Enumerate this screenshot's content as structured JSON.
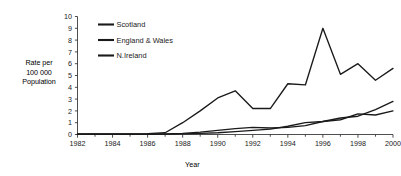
{
  "chart_data": {
    "type": "line",
    "title": "",
    "xlabel": "Year",
    "ylabel": "Rate per 100 000 Population",
    "ylabel_lines": [
      "Rate per",
      "100 000",
      "Population"
    ],
    "xlim": [
      1982,
      2000
    ],
    "ylim": [
      0,
      10
    ],
    "ytick_step": 1,
    "xtick_step": 2,
    "xtick_minor_step": 1,
    "grid": false,
    "legend_position": "top-left-inside",
    "ytick_labels": [
      "0",
      "1",
      "2",
      "3",
      "4",
      "5",
      "6",
      "7",
      "8",
      "9",
      "10"
    ],
    "xtick_labels": [
      "1982",
      "1984",
      "1986",
      "1988",
      "1990",
      "1992",
      "1994",
      "1996",
      "1998",
      "2000"
    ],
    "x": [
      1982,
      1983,
      1984,
      1985,
      1986,
      1987,
      1988,
      1989,
      1990,
      1991,
      1992,
      1993,
      1994,
      1995,
      1996,
      1997,
      1998,
      1999,
      2000
    ],
    "series": [
      {
        "name": "Scotland",
        "color": "#1a1a1a",
        "values": [
          0.05,
          0.05,
          0.05,
          0.05,
          0.08,
          0.15,
          1.0,
          2.0,
          3.1,
          3.7,
          2.2,
          2.2,
          4.3,
          4.2,
          9.0,
          5.1,
          6.0,
          4.6,
          5.6
        ]
      },
      {
        "name": "England & Wales",
        "color": "#1a1a1a",
        "values": [
          0.02,
          0.02,
          0.02,
          0.02,
          0.03,
          0.05,
          0.1,
          0.2,
          0.35,
          0.5,
          0.6,
          0.55,
          0.6,
          0.75,
          1.1,
          1.4,
          1.55,
          2.1,
          2.8
        ]
      },
      {
        "name": "N.Ireland",
        "color": "#1a1a1a",
        "values": [
          0.02,
          0.02,
          0.02,
          0.02,
          0.02,
          0.03,
          0.05,
          0.1,
          0.15,
          0.25,
          0.35,
          0.45,
          0.7,
          1.0,
          1.1,
          1.25,
          1.75,
          1.65,
          2.0
        ]
      }
    ]
  }
}
